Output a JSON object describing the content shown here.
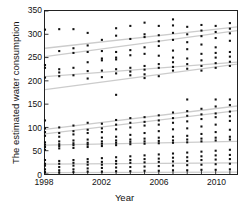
{
  "chart_data": {
    "type": "scatter",
    "title": "",
    "xlabel": "Year",
    "ylabel": "The estimated water consumption",
    "xlim": [
      1998,
      2011.5
    ],
    "ylim": [
      0,
      350
    ],
    "grid": false,
    "legend": null,
    "y_ticks": [
      0,
      50,
      100,
      150,
      200,
      250,
      300,
      350
    ],
    "y_tick_labels": [
      "0",
      "50",
      "100",
      "150",
      "200",
      "250",
      "300",
      "350"
    ],
    "x_ticks": [
      1998,
      1999,
      2000,
      2001,
      2002,
      2003,
      2004,
      2005,
      2006,
      2007,
      2008,
      2009,
      2010,
      2011
    ],
    "x_tick_labels_major": [
      "1998",
      "2002",
      "2006",
      "2010"
    ],
    "x_ticks_major": [
      1998,
      2002,
      2006,
      2010
    ],
    "marker": "square",
    "marker_color": "#111111",
    "marker_size": 2.1,
    "trend_line_color": "#cccccc",
    "axis_color": "#222222",
    "points": [
      [
        1998,
        310
      ],
      [
        1998,
        234
      ],
      [
        1998,
        228
      ],
      [
        1998,
        207
      ],
      [
        1998,
        115
      ],
      [
        1998,
        98
      ],
      [
        1998,
        90
      ],
      [
        1998,
        82
      ],
      [
        1998,
        68
      ],
      [
        1998,
        63
      ],
      [
        1998,
        58
      ],
      [
        1998,
        52
      ],
      [
        1998,
        30
      ],
      [
        1998,
        22
      ],
      [
        1998,
        18
      ],
      [
        1998,
        10
      ],
      [
        1998,
        4
      ],
      [
        1999,
        311
      ],
      [
        1999,
        264
      ],
      [
        1999,
        225
      ],
      [
        1999,
        218
      ],
      [
        1999,
        210
      ],
      [
        1999,
        100
      ],
      [
        1999,
        88
      ],
      [
        1999,
        80
      ],
      [
        1999,
        70
      ],
      [
        1999,
        64
      ],
      [
        1999,
        60
      ],
      [
        1999,
        55
      ],
      [
        1999,
        28
      ],
      [
        1999,
        22
      ],
      [
        1999,
        15
      ],
      [
        1999,
        8
      ],
      [
        1999,
        3
      ],
      [
        2000,
        311
      ],
      [
        2000,
        270
      ],
      [
        2000,
        260
      ],
      [
        2000,
        228
      ],
      [
        2000,
        212
      ],
      [
        2000,
        104
      ],
      [
        2000,
        92
      ],
      [
        2000,
        85
      ],
      [
        2000,
        72
      ],
      [
        2000,
        66
      ],
      [
        2000,
        62
      ],
      [
        2000,
        56
      ],
      [
        2000,
        30
      ],
      [
        2000,
        24
      ],
      [
        2000,
        18
      ],
      [
        2000,
        10
      ],
      [
        2000,
        4
      ],
      [
        2001,
        303
      ],
      [
        2001,
        276
      ],
      [
        2001,
        262
      ],
      [
        2001,
        240
      ],
      [
        2001,
        221
      ],
      [
        2001,
        205
      ],
      [
        2001,
        110
      ],
      [
        2001,
        95
      ],
      [
        2001,
        88
      ],
      [
        2001,
        74
      ],
      [
        2001,
        67
      ],
      [
        2001,
        63
      ],
      [
        2001,
        58
      ],
      [
        2001,
        32
      ],
      [
        2001,
        26
      ],
      [
        2001,
        20
      ],
      [
        2001,
        12
      ],
      [
        2001,
        5
      ],
      [
        2002,
        288
      ],
      [
        2002,
        264
      ],
      [
        2002,
        248
      ],
      [
        2002,
        244
      ],
      [
        2002,
        222
      ],
      [
        2002,
        208
      ],
      [
        2002,
        108
      ],
      [
        2002,
        98
      ],
      [
        2002,
        90
      ],
      [
        2002,
        78
      ],
      [
        2002,
        70
      ],
      [
        2002,
        65
      ],
      [
        2002,
        60
      ],
      [
        2002,
        34
      ],
      [
        2002,
        26
      ],
      [
        2002,
        20
      ],
      [
        2002,
        13
      ],
      [
        2002,
        5
      ],
      [
        2003,
        313
      ],
      [
        2003,
        297
      ],
      [
        2003,
        262
      ],
      [
        2003,
        250
      ],
      [
        2003,
        246
      ],
      [
        2003,
        225
      ],
      [
        2003,
        216
      ],
      [
        2003,
        170
      ],
      [
        2003,
        116
      ],
      [
        2003,
        106
      ],
      [
        2003,
        96
      ],
      [
        2003,
        80
      ],
      [
        2003,
        72
      ],
      [
        2003,
        67
      ],
      [
        2003,
        62
      ],
      [
        2003,
        36
      ],
      [
        2003,
        28
      ],
      [
        2003,
        22
      ],
      [
        2003,
        14
      ],
      [
        2003,
        6
      ],
      [
        2004,
        318
      ],
      [
        2004,
        290
      ],
      [
        2004,
        266
      ],
      [
        2004,
        255
      ],
      [
        2004,
        228
      ],
      [
        2004,
        220
      ],
      [
        2004,
        212
      ],
      [
        2004,
        120
      ],
      [
        2004,
        110
      ],
      [
        2004,
        100
      ],
      [
        2004,
        84
      ],
      [
        2004,
        74
      ],
      [
        2004,
        69
      ],
      [
        2004,
        64
      ],
      [
        2004,
        38
      ],
      [
        2004,
        30
      ],
      [
        2004,
        24
      ],
      [
        2004,
        15
      ],
      [
        2004,
        6
      ],
      [
        2005,
        325
      ],
      [
        2005,
        300
      ],
      [
        2005,
        294
      ],
      [
        2005,
        272
      ],
      [
        2005,
        258
      ],
      [
        2005,
        232
      ],
      [
        2005,
        224
      ],
      [
        2005,
        214
      ],
      [
        2005,
        206
      ],
      [
        2005,
        122
      ],
      [
        2005,
        112
      ],
      [
        2005,
        104
      ],
      [
        2005,
        88
      ],
      [
        2005,
        76
      ],
      [
        2005,
        70
      ],
      [
        2005,
        65
      ],
      [
        2005,
        40
      ],
      [
        2005,
        32
      ],
      [
        2005,
        25
      ],
      [
        2005,
        16
      ],
      [
        2005,
        7
      ],
      [
        2006,
        318
      ],
      [
        2006,
        298
      ],
      [
        2006,
        285
      ],
      [
        2006,
        275
      ],
      [
        2006,
        254
      ],
      [
        2006,
        236
      ],
      [
        2006,
        228
      ],
      [
        2006,
        210
      ],
      [
        2006,
        126
      ],
      [
        2006,
        115
      ],
      [
        2006,
        106
      ],
      [
        2006,
        92
      ],
      [
        2006,
        78
      ],
      [
        2006,
        71
      ],
      [
        2006,
        66
      ],
      [
        2006,
        42
      ],
      [
        2006,
        33
      ],
      [
        2006,
        26
      ],
      [
        2006,
        17
      ],
      [
        2006,
        7
      ],
      [
        2007,
        332
      ],
      [
        2007,
        319
      ],
      [
        2007,
        303
      ],
      [
        2007,
        288
      ],
      [
        2007,
        265
      ],
      [
        2007,
        250
      ],
      [
        2007,
        240
      ],
      [
        2007,
        230
      ],
      [
        2007,
        222
      ],
      [
        2007,
        132
      ],
      [
        2007,
        120
      ],
      [
        2007,
        110
      ],
      [
        2007,
        96
      ],
      [
        2007,
        80
      ],
      [
        2007,
        72
      ],
      [
        2007,
        67
      ],
      [
        2007,
        44
      ],
      [
        2007,
        35
      ],
      [
        2007,
        27
      ],
      [
        2007,
        18
      ],
      [
        2007,
        8
      ],
      [
        2008,
        316
      ],
      [
        2008,
        300
      ],
      [
        2008,
        283
      ],
      [
        2008,
        268
      ],
      [
        2008,
        248
      ],
      [
        2008,
        236
      ],
      [
        2008,
        226
      ],
      [
        2008,
        160
      ],
      [
        2008,
        135
      ],
      [
        2008,
        125
      ],
      [
        2008,
        113
      ],
      [
        2008,
        98
      ],
      [
        2008,
        82
      ],
      [
        2008,
        74
      ],
      [
        2008,
        68
      ],
      [
        2008,
        46
      ],
      [
        2008,
        36
      ],
      [
        2008,
        28
      ],
      [
        2008,
        19
      ],
      [
        2008,
        8
      ],
      [
        2009,
        320
      ],
      [
        2009,
        308
      ],
      [
        2009,
        296
      ],
      [
        2009,
        278
      ],
      [
        2009,
        258
      ],
      [
        2009,
        244
      ],
      [
        2009,
        232
      ],
      [
        2009,
        222
      ],
      [
        2009,
        140
      ],
      [
        2009,
        128
      ],
      [
        2009,
        118
      ],
      [
        2009,
        102
      ],
      [
        2009,
        86
      ],
      [
        2009,
        76
      ],
      [
        2009,
        70
      ],
      [
        2009,
        48
      ],
      [
        2009,
        38
      ],
      [
        2009,
        30
      ],
      [
        2009,
        20
      ],
      [
        2009,
        9
      ],
      [
        2010,
        318
      ],
      [
        2010,
        305
      ],
      [
        2010,
        292
      ],
      [
        2010,
        272
      ],
      [
        2010,
        260
      ],
      [
        2010,
        250
      ],
      [
        2010,
        238
      ],
      [
        2010,
        228
      ],
      [
        2010,
        160
      ],
      [
        2010,
        145
      ],
      [
        2010,
        130
      ],
      [
        2010,
        122
      ],
      [
        2010,
        106
      ],
      [
        2010,
        90
      ],
      [
        2010,
        78
      ],
      [
        2010,
        72
      ],
      [
        2010,
        50
      ],
      [
        2010,
        40
      ],
      [
        2010,
        31
      ],
      [
        2010,
        21
      ],
      [
        2010,
        9
      ],
      [
        2011,
        324
      ],
      [
        2011,
        312
      ],
      [
        2011,
        302
      ],
      [
        2011,
        286
      ],
      [
        2011,
        262
      ],
      [
        2011,
        252
      ],
      [
        2011,
        241
      ],
      [
        2011,
        232
      ],
      [
        2011,
        160
      ],
      [
        2011,
        148
      ],
      [
        2011,
        134
      ],
      [
        2011,
        124
      ],
      [
        2011,
        114
      ],
      [
        2011,
        95
      ],
      [
        2011,
        80
      ],
      [
        2011,
        74
      ],
      [
        2011,
        52
      ],
      [
        2011,
        41
      ],
      [
        2011,
        32
      ],
      [
        2011,
        22
      ],
      [
        2011,
        10
      ]
    ],
    "trend_lines": [
      {
        "name": "band-1-upper",
        "x0": 1998,
        "y0": 270,
        "x1": 2011.5,
        "y1": 316
      },
      {
        "name": "band-1-lower",
        "x0": 1998,
        "y0": 252,
        "x1": 2011.5,
        "y1": 308
      },
      {
        "name": "band-2-upper",
        "x0": 1998,
        "y0": 209,
        "x1": 2011.5,
        "y1": 240
      },
      {
        "name": "band-2-lower",
        "x0": 1998,
        "y0": 181,
        "x1": 2011.5,
        "y1": 236
      },
      {
        "name": "band-3-upper",
        "x0": 1998,
        "y0": 96,
        "x1": 2011.5,
        "y1": 146
      },
      {
        "name": "band-3-lower",
        "x0": 1998,
        "y0": 86,
        "x1": 2011.5,
        "y1": 136
      },
      {
        "name": "band-4",
        "x0": 1998,
        "y0": 62,
        "x1": 2011.5,
        "y1": 70
      },
      {
        "name": "band-5",
        "x0": 1998,
        "y0": 21,
        "x1": 2011.5,
        "y1": 24
      },
      {
        "name": "band-6",
        "x0": 1998,
        "y0": 3,
        "x1": 2011.5,
        "y1": 4
      }
    ]
  },
  "axes": {
    "ylabel": "The estimated water consumption",
    "xlabel": "Year"
  }
}
